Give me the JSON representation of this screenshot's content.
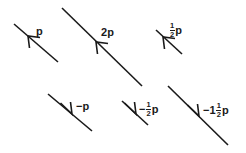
{
  "figure": {
    "background_color": "#ffffff",
    "stroke_color": "#1a1a1a",
    "label_color": "#1a1a1a",
    "base_symbol": "p"
  },
  "vectors": [
    {
      "id": "vector-p",
      "name": "p",
      "scalar": 1,
      "label_text": "p",
      "label_parts": {
        "sign": "",
        "whole": "",
        "numerator": "",
        "denominator": "",
        "symbol": "p"
      },
      "has_fraction": false,
      "direction": "up-left",
      "line": {
        "x1": 58,
        "y1": 62,
        "x2": 14,
        "y2": 24
      },
      "arrow_tip": {
        "x": 28,
        "y": 36
      },
      "label_pos": {
        "x": 36,
        "y": 26
      }
    },
    {
      "id": "vector-2p",
      "name": "2p",
      "scalar": 2,
      "label_text": "2p",
      "label_parts": {
        "sign": "",
        "whole": "2",
        "numerator": "",
        "denominator": "",
        "symbol": "p"
      },
      "has_fraction": false,
      "direction": "up-left",
      "line": {
        "x1": 142,
        "y1": 86,
        "x2": 62,
        "y2": 8
      },
      "arrow_tip": {
        "x": 96,
        "y": 42
      },
      "label_pos": {
        "x": 101,
        "y": 27
      }
    },
    {
      "id": "vector-half-p",
      "name": "1/2 p",
      "scalar": 0.5,
      "label_text": "½p",
      "label_parts": {
        "sign": "",
        "whole": "",
        "numerator": "1",
        "denominator": "2",
        "symbol": "p"
      },
      "has_fraction": true,
      "direction": "up-left",
      "line": {
        "x1": 182,
        "y1": 54,
        "x2": 156,
        "y2": 30
      },
      "arrow_tip": {
        "x": 163,
        "y": 37
      },
      "label_pos": {
        "x": 169,
        "y": 22
      }
    },
    {
      "id": "vector-neg-p",
      "name": "-p",
      "scalar": -1,
      "label_text": "−p",
      "label_parts": {
        "sign": "−",
        "whole": "",
        "numerator": "",
        "denominator": "",
        "symbol": "p"
      },
      "has_fraction": false,
      "direction": "down-right",
      "line": {
        "x1": 48,
        "y1": 94,
        "x2": 92,
        "y2": 131
      },
      "arrow_tip": {
        "x": 72,
        "y": 114
      },
      "label_pos": {
        "x": 76,
        "y": 101
      }
    },
    {
      "id": "vector-neg-half-p",
      "name": "-1/2 p",
      "scalar": -0.5,
      "label_text": "−½p",
      "label_parts": {
        "sign": "−",
        "whole": "",
        "numerator": "1",
        "denominator": "2",
        "symbol": "p"
      },
      "has_fraction": true,
      "direction": "down-right",
      "line": {
        "x1": 122,
        "y1": 101,
        "x2": 148,
        "y2": 125
      },
      "arrow_tip": {
        "x": 136,
        "y": 114
      },
      "label_pos": {
        "x": 139,
        "y": 101
      }
    },
    {
      "id": "vector-neg-one-and-half-p",
      "name": "-1 1/2 p",
      "scalar": -1.5,
      "label_text": "−1½p",
      "label_parts": {
        "sign": "−",
        "whole": "1",
        "numerator": "1",
        "denominator": "2",
        "symbol": "p"
      },
      "has_fraction": true,
      "direction": "down-right",
      "line": {
        "x1": 168,
        "y1": 86,
        "x2": 228,
        "y2": 145
      },
      "arrow_tip": {
        "x": 199,
        "y": 116
      },
      "label_pos": {
        "x": 203,
        "y": 102
      }
    }
  ]
}
